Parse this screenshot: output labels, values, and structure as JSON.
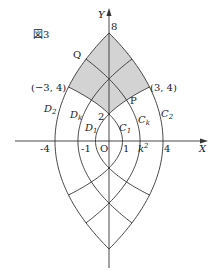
{
  "figure": {
    "caption": "図3",
    "axes": {
      "x_label": "X",
      "y_label": "Y",
      "origin_label": "O"
    },
    "parameter_k_squared": 2.3,
    "x_ticks": [
      {
        "value": -4,
        "label": "-4"
      },
      {
        "value": -1,
        "label": "-1"
      },
      {
        "value": 1,
        "label": "1"
      },
      {
        "value": "k2",
        "label_base": "k",
        "label_sup": "2"
      },
      {
        "value": 4,
        "label": "4"
      }
    ],
    "y_ticks": [
      {
        "value": 8,
        "label": "8"
      },
      {
        "value": 2,
        "label": "2"
      }
    ],
    "points": {
      "left": {
        "label": "(−3, 4)",
        "x": -3,
        "y": 4
      },
      "right": {
        "label": "(3, 4)",
        "x": 3,
        "y": 4
      },
      "P": {
        "label": "P"
      },
      "Q": {
        "label": "Q"
      }
    },
    "curve_families": {
      "C": [
        {
          "name": "C",
          "sub": "1",
          "a": 1
        },
        {
          "name": "C",
          "sub": "k",
          "a": "k2"
        },
        {
          "name": "C",
          "sub": "2",
          "a": 4
        }
      ],
      "D": [
        {
          "name": "D",
          "sub": "1",
          "a": 1
        },
        {
          "name": "D",
          "sub": "k",
          "a": "k2"
        },
        {
          "name": "D",
          "sub": "2",
          "a": 4
        }
      ]
    },
    "shaded_region": {
      "description": "region bounded by C2, D2 above and C1, D1 below (y>0)",
      "fill": "#d3d3d3"
    },
    "stroke_color": "#333333"
  }
}
